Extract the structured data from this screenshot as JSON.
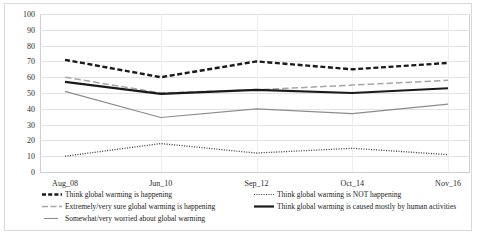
{
  "chart_data": {
    "type": "line",
    "title": "",
    "subtitle": "",
    "xlabel": "",
    "ylabel": "",
    "categories": [
      "Aug_08",
      "Jun_10",
      "Sep_12",
      "Oct_14",
      "Nov_16"
    ],
    "ylim": [
      0,
      100
    ],
    "ytick_labels": [
      "0",
      "10",
      "20",
      "30",
      "40",
      "50",
      "60",
      "70",
      "80",
      "90",
      "100"
    ],
    "ytick_values": [
      0,
      10,
      20,
      30,
      40,
      50,
      60,
      70,
      80,
      90,
      100
    ],
    "grid": true,
    "legend_position": "bottom",
    "series": [
      {
        "name": "Think global warming is happening",
        "values": [
          71,
          60,
          70,
          65,
          69
        ],
        "style": "thick-dashed",
        "color": "#1a1a1a"
      },
      {
        "name": "Think global warming is NOT happening",
        "values": [
          10,
          18,
          12,
          15,
          11
        ],
        "style": "dotted",
        "color": "#3a3a3a"
      },
      {
        "name": "Extremely/very sure global warming is happening",
        "values": [
          60,
          50,
          52,
          55,
          58
        ],
        "style": "dashed",
        "color": "#a6a6a6"
      },
      {
        "name": "Think global warming is caused mostly by human activities",
        "values": [
          57,
          49.5,
          52,
          50,
          53
        ],
        "style": "thick-solid",
        "color": "#1a1a1a"
      },
      {
        "name": "Somewhat/very worried about global warming",
        "values": [
          51,
          34.5,
          40,
          37,
          43
        ],
        "style": "solid",
        "color": "#8c8c8c"
      }
    ]
  },
  "legend": {
    "row1_left": "Think global warming is happening",
    "row1_right": "Think global warming is NOT happening",
    "row2_left": "Extremely/very sure global warming is happening",
    "row2_right": "Think global warming is caused mostly by human activities",
    "row3_left": "Somewhat/very worried about global warming"
  }
}
